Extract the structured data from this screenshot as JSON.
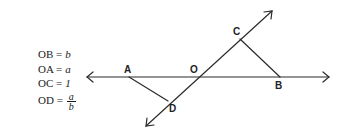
{
  "equations": [
    {
      "lhs": "OB =",
      "rhs": "b"
    },
    {
      "lhs": "OA =",
      "rhs": "a"
    },
    {
      "lhs": "OC =",
      "rhs": "1"
    },
    {
      "lhs": "OD =",
      "numerator": "a",
      "denominator": "b"
    }
  ],
  "points": {
    "A": "A",
    "B": "B",
    "C": "C",
    "D": "D",
    "O": "O"
  },
  "colors": {
    "line": "#2b2b2b",
    "text": "#1a1a1a"
  }
}
